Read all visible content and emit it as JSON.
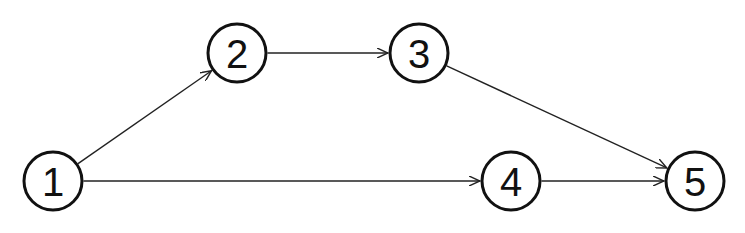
{
  "diagram": {
    "type": "directed-graph",
    "node_radius": 29,
    "colors": {
      "stroke": "#111111",
      "edge": "#222222",
      "background": "#ffffff"
    },
    "nodes": [
      {
        "id": "1",
        "label": "1",
        "x": 53,
        "y": 181
      },
      {
        "id": "2",
        "label": "2",
        "x": 237,
        "y": 53
      },
      {
        "id": "3",
        "label": "3",
        "x": 419,
        "y": 53
      },
      {
        "id": "4",
        "label": "4",
        "x": 511,
        "y": 181
      },
      {
        "id": "5",
        "label": "5",
        "x": 695,
        "y": 181
      }
    ],
    "edges": [
      {
        "from": "1",
        "to": "2"
      },
      {
        "from": "2",
        "to": "3"
      },
      {
        "from": "3",
        "to": "5"
      },
      {
        "from": "1",
        "to": "4"
      },
      {
        "from": "4",
        "to": "5"
      }
    ]
  }
}
